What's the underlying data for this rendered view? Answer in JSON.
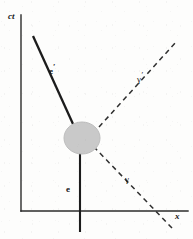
{
  "figure": {
    "kind": "spacetime-diagram",
    "title_visible": false,
    "background_color": "#fdfdfc",
    "ink_color": "#161616",
    "blob_color": "#c9c9c9",
    "blob_edge_color": "#b5b5b5"
  },
  "axes": {
    "vertical": {
      "label": "ct",
      "x": 21,
      "y_top": 15,
      "y_bottom": 211,
      "label_x": 8,
      "label_y": 14
    },
    "horizontal": {
      "label": "x",
      "y": 211,
      "x_left": 21,
      "x_right": 188,
      "label_x": 175,
      "label_y": 214
    }
  },
  "vertex": {
    "name": "interaction-blob",
    "cx": 82,
    "cy": 138,
    "rx": 18,
    "ry": 16
  },
  "lines": [
    {
      "name": "electron-incoming",
      "label": "e",
      "prime": "",
      "style": "solid",
      "stroke_width": 2.1,
      "x1": 80,
      "y1": 232,
      "x2": 80,
      "y2": 150,
      "label_x": 66,
      "label_y": 186
    },
    {
      "name": "electron-outgoing",
      "label": "e",
      "prime": "′",
      "style": "solid",
      "stroke_width": 2.1,
      "x1": 33,
      "y1": 36,
      "x2": 73,
      "y2": 124,
      "label_x": 49,
      "label_y": 68
    },
    {
      "name": "photon-incoming",
      "label": "γ",
      "prime": "",
      "style": "dashed",
      "stroke_width": 1.5,
      "x1": 172,
      "y1": 228,
      "x2": 95,
      "y2": 148,
      "label_x": 125,
      "label_y": 176
    },
    {
      "name": "photon-outgoing",
      "label": "γ",
      "prime": "′",
      "style": "dashed",
      "stroke_width": 1.5,
      "x1": 99,
      "y1": 127,
      "x2": 176,
      "y2": 42,
      "label_x": 137,
      "label_y": 76
    }
  ]
}
